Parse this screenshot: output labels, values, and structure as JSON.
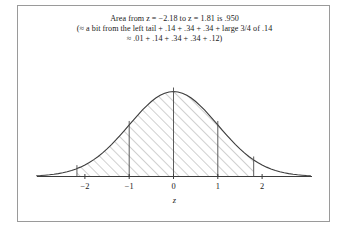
{
  "figure": {
    "caption_lines": [
      "Area from z = −2.18 to z = 1.81 is .950",
      "(≈ a bit from the left tail + .14 + .34 + .34 + large 3/4 of .14",
      "≈ .01 + .14 + .34 + .34 + .12)"
    ],
    "axis_label": "z",
    "border_color": "#9a9a9a",
    "curve_color": "#3c3c3c",
    "hatch_color": "#8a8a8a",
    "text_color": "#1a1a1a"
  },
  "chart_data": {
    "type": "area",
    "title": "Area from z = −2.18 to z = 1.81 is .950",
    "xlabel": "z",
    "ylabel": "",
    "xlim": [
      -3.1,
      3.1
    ],
    "ylim": [
      0,
      0.42
    ],
    "grid": false,
    "legend": null,
    "distribution": "standard normal density",
    "tick_labels": [
      "−2",
      "−1",
      "0",
      "1",
      "2"
    ],
    "tick_values": [
      -2,
      -1,
      0,
      1,
      2
    ],
    "shaded_region": {
      "from": -2.18,
      "to": 1.81,
      "area": 0.95,
      "fill": "diagonal-hatch"
    },
    "vertical_lines": [
      -2.18,
      -1,
      0,
      1,
      1.81
    ],
    "component_areas": [
      {
        "label": "left tail portion",
        "value": 0.01
      },
      {
        "label": "−2 to −1",
        "value": 0.14
      },
      {
        "label": "−1 to 0",
        "value": 0.34
      },
      {
        "label": "0 to 1",
        "value": 0.34
      },
      {
        "label": "1 to 1.81",
        "value": 0.12
      }
    ],
    "sum_expression": ".01 + .14 + .34 + .34 + .12",
    "x": [
      -3.1,
      -3.0,
      -2.9,
      -2.8,
      -2.7,
      -2.6,
      -2.5,
      -2.4,
      -2.3,
      -2.2,
      -2.18,
      -2.1,
      -2.0,
      -1.9,
      -1.8,
      -1.7,
      -1.6,
      -1.5,
      -1.4,
      -1.3,
      -1.2,
      -1.1,
      -1.0,
      -0.9,
      -0.8,
      -0.7,
      -0.6,
      -0.5,
      -0.4,
      -0.3,
      -0.2,
      -0.1,
      0.0,
      0.1,
      0.2,
      0.3,
      0.4,
      0.5,
      0.6,
      0.7,
      0.8,
      0.9,
      1.0,
      1.1,
      1.2,
      1.3,
      1.4,
      1.5,
      1.6,
      1.7,
      1.8,
      1.81,
      1.9,
      2.0,
      2.1,
      2.2,
      2.3,
      2.4,
      2.5,
      2.6,
      2.7,
      2.8,
      2.9,
      3.0,
      3.1
    ],
    "y": [
      0.0033,
      0.0044,
      0.006,
      0.0079,
      0.0104,
      0.0136,
      0.0175,
      0.0224,
      0.0283,
      0.0355,
      0.0371,
      0.044,
      0.054,
      0.0656,
      0.079,
      0.094,
      0.1109,
      0.1295,
      0.1497,
      0.1714,
      0.1942,
      0.2179,
      0.242,
      0.2661,
      0.2897,
      0.3123,
      0.3332,
      0.3521,
      0.3683,
      0.3814,
      0.391,
      0.397,
      0.3989,
      0.397,
      0.391,
      0.3814,
      0.3683,
      0.3521,
      0.3332,
      0.3123,
      0.2897,
      0.2661,
      0.242,
      0.2179,
      0.1942,
      0.1714,
      0.1497,
      0.1295,
      0.1109,
      0.094,
      0.079,
      0.0775,
      0.0656,
      0.054,
      0.044,
      0.0355,
      0.0283,
      0.0224,
      0.0175,
      0.0136,
      0.0104,
      0.0079,
      0.006,
      0.0044,
      0.0033
    ]
  }
}
